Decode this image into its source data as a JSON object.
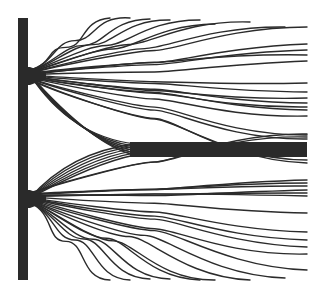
{
  "diagram": {
    "title": "Double-slit streamline pattern",
    "colors": {
      "background": "#ffffff",
      "ink": "#2b2b2b",
      "wall": "#2a2a2a"
    },
    "wall": {
      "x": 18,
      "width": 10,
      "top": 18,
      "bottom": 280
    },
    "slits": [
      {
        "name": "upper-slit",
        "x": 28,
        "y": 75
      },
      {
        "name": "lower-slit",
        "x": 28,
        "y": 198
      }
    ],
    "central_band": {
      "x_start": 130,
      "x_end": 307,
      "y_top": 142,
      "y_bottom": 157
    },
    "upper_fan_endpoints": [
      [
        110,
        18
      ],
      [
        130,
        18
      ],
      [
        150,
        19
      ],
      [
        170,
        20
      ],
      [
        200,
        20
      ],
      [
        215,
        24
      ],
      [
        250,
        22
      ],
      [
        285,
        27
      ],
      [
        307,
        27
      ],
      [
        307,
        44
      ],
      [
        307,
        50
      ],
      [
        307,
        55
      ],
      [
        307,
        61
      ],
      [
        307,
        83
      ],
      [
        307,
        92
      ],
      [
        307,
        98
      ],
      [
        307,
        103
      ],
      [
        307,
        107
      ],
      [
        307,
        110
      ],
      [
        307,
        116
      ],
      [
        307,
        135
      ],
      [
        307,
        139
      ],
      [
        307,
        160
      ],
      [
        307,
        163
      ]
    ],
    "lower_fan_endpoints": [
      [
        307,
        134
      ],
      [
        307,
        137
      ],
      [
        307,
        180
      ],
      [
        307,
        183
      ],
      [
        307,
        186
      ],
      [
        307,
        190
      ],
      [
        307,
        193
      ],
      [
        307,
        196
      ],
      [
        307,
        213
      ],
      [
        307,
        232
      ],
      [
        307,
        240
      ],
      [
        307,
        247
      ],
      [
        307,
        254
      ],
      [
        307,
        270
      ],
      [
        285,
        278
      ],
      [
        250,
        280
      ],
      [
        215,
        280
      ],
      [
        200,
        280
      ],
      [
        170,
        279
      ],
      [
        150,
        279
      ],
      [
        130,
        280
      ],
      [
        110,
        280
      ]
    ]
  }
}
